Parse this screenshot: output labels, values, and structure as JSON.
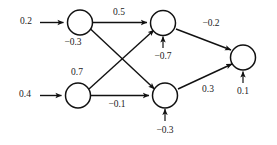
{
  "diagram": {
    "kind": "neural-network",
    "title": "",
    "colors": {
      "background": "#ffffff",
      "stroke": "#111111",
      "text": "#1a1a1a"
    },
    "inputs": [
      {
        "id": "in1",
        "label": "0.2"
      },
      {
        "id": "in2",
        "label": "0.4"
      }
    ],
    "nodes": [
      {
        "id": "h1",
        "bias": "−0.3",
        "bias_position": "below",
        "bias_arrow": false
      },
      {
        "id": "h2",
        "bias": "0.7",
        "bias_position": "above",
        "bias_arrow": false
      },
      {
        "id": "h3",
        "bias": "−0.7",
        "bias_position": "below",
        "bias_arrow": true
      },
      {
        "id": "h4",
        "bias": "−0.3",
        "bias_position": "below",
        "bias_arrow": true
      },
      {
        "id": "out",
        "bias": "0.1",
        "bias_position": "below",
        "bias_arrow": true
      }
    ],
    "edges": [
      {
        "id": "e_h1_h3",
        "from": "h1",
        "to": "h3",
        "label": "0.5"
      },
      {
        "id": "e_h1_h4",
        "from": "h1",
        "to": "h4",
        "label": ""
      },
      {
        "id": "e_h2_h3",
        "from": "h2",
        "to": "h3",
        "label": ""
      },
      {
        "id": "e_h2_h4",
        "from": "h2",
        "to": "h4",
        "label": "−0.1"
      },
      {
        "id": "e_h3_out",
        "from": "h3",
        "to": "out",
        "label": "−0.2"
      },
      {
        "id": "e_h4_out",
        "from": "h4",
        "to": "out",
        "label": "0.3"
      }
    ]
  }
}
